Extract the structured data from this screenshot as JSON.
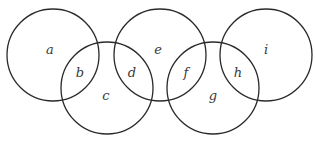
{
  "diagram": {
    "type": "interlocking-circles",
    "stroke_color": "#2a2a2a",
    "circles": [
      {
        "id": "circle-1",
        "cx": 53,
        "cy": 55,
        "r": 46
      },
      {
        "id": "circle-2",
        "cx": 107,
        "cy": 88,
        "r": 46
      },
      {
        "id": "circle-3",
        "cx": 160,
        "cy": 55,
        "r": 46
      },
      {
        "id": "circle-4",
        "cx": 213,
        "cy": 88,
        "r": 46
      },
      {
        "id": "circle-5",
        "cx": 266,
        "cy": 55,
        "r": 46
      }
    ],
    "regions": [
      {
        "label": "a",
        "x": 50,
        "y": 54
      },
      {
        "label": "b",
        "x": 80,
        "y": 77
      },
      {
        "label": "c",
        "x": 106,
        "y": 100
      },
      {
        "label": "d",
        "x": 132,
        "y": 77
      },
      {
        "label": "e",
        "x": 158,
        "y": 54
      },
      {
        "label": "f",
        "x": 186,
        "y": 77
      },
      {
        "label": "g",
        "x": 213,
        "y": 100
      },
      {
        "label": "h",
        "x": 238,
        "y": 77
      },
      {
        "label": "i",
        "x": 266,
        "y": 54
      }
    ]
  }
}
